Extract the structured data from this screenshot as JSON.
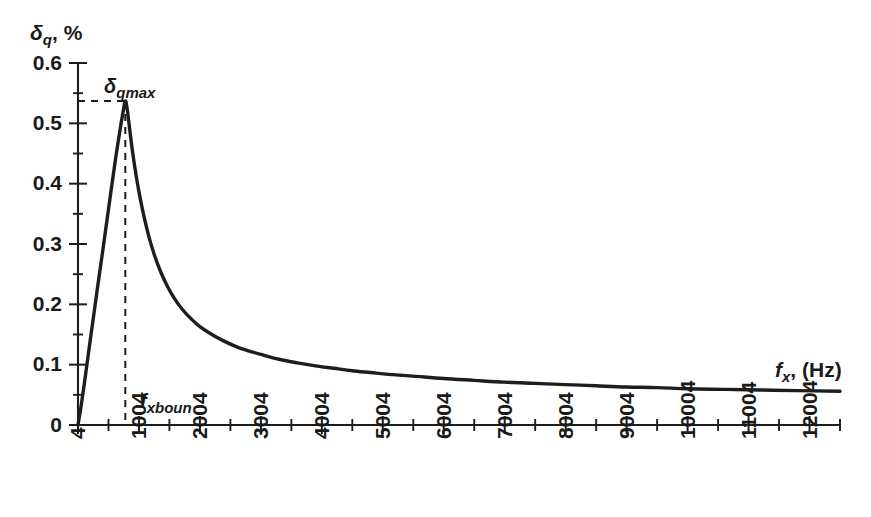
{
  "chart_data": {
    "type": "line",
    "title": "",
    "xlabel": "f_x, (Hz)",
    "ylabel": "δ_q, %",
    "xlabel_parts": {
      "main": "f",
      "sub": "x",
      "tail": ", (Hz)"
    },
    "ylabel_parts": {
      "main": "δ",
      "sub": "q",
      "tail": ", %"
    },
    "xlim": [
      4,
      12504
    ],
    "ylim": [
      0,
      0.6
    ],
    "grid": false,
    "legend": "none",
    "x_ticks": [
      4,
      1004,
      2004,
      3004,
      4004,
      5004,
      6004,
      7004,
      8004,
      9004,
      10004,
      11004,
      12004
    ],
    "x_tick_labels": [
      "4",
      "1004",
      "2004",
      "3004",
      "4004",
      "5004",
      "6004",
      "7004",
      "8004",
      "9004",
      "10004",
      "11004",
      "12004"
    ],
    "x_minor_ticks": [
      504,
      1504,
      2504,
      3504,
      4504,
      5504,
      6504,
      7504,
      8504,
      9504,
      10504,
      11504,
      12504
    ],
    "y_ticks": [
      0,
      0.1,
      0.2,
      0.3,
      0.4,
      0.5,
      0.6
    ],
    "y_tick_labels": [
      "0",
      "0.1",
      "0.2",
      "0.3",
      "0.4",
      "0.5",
      "0.6"
    ],
    "y_minor_ticks": [
      0.05,
      0.15,
      0.25,
      0.35,
      0.45,
      0.55
    ],
    "annotations": [
      {
        "name": "peak-label",
        "text_parts": {
          "main": "δ",
          "sub": "qmax"
        },
        "x": 780,
        "y": 0.585
      },
      {
        "name": "boundary-label",
        "text_parts": {
          "main": "f",
          "sub": "xboun"
        },
        "x": 1700,
        "y": 0.058
      }
    ],
    "markers": {
      "peak_x": 780,
      "peak_y": 0.537,
      "dashed_horizontal_from_x": 4,
      "dashed_vertical_to_y": 0
    },
    "series": [
      {
        "name": "delta_q",
        "color": "#1d1d1d",
        "points": [
          [
            4,
            0.0
          ],
          [
            60,
            0.035
          ],
          [
            130,
            0.085
          ],
          [
            200,
            0.137
          ],
          [
            270,
            0.188
          ],
          [
            340,
            0.239
          ],
          [
            410,
            0.289
          ],
          [
            480,
            0.34
          ],
          [
            550,
            0.391
          ],
          [
            620,
            0.441
          ],
          [
            690,
            0.487
          ],
          [
            740,
            0.517
          ],
          [
            780,
            0.537
          ],
          [
            810,
            0.524
          ],
          [
            850,
            0.492
          ],
          [
            900,
            0.452
          ],
          [
            960,
            0.412
          ],
          [
            1020,
            0.378
          ],
          [
            1090,
            0.344
          ],
          [
            1170,
            0.311
          ],
          [
            1260,
            0.281
          ],
          [
            1360,
            0.254
          ],
          [
            1470,
            0.23
          ],
          [
            1590,
            0.209
          ],
          [
            1720,
            0.191
          ],
          [
            1860,
            0.176
          ],
          [
            2004,
            0.163
          ],
          [
            2200,
            0.15
          ],
          [
            2400,
            0.139
          ],
          [
            2600,
            0.13
          ],
          [
            2800,
            0.123
          ],
          [
            3004,
            0.117
          ],
          [
            3300,
            0.109
          ],
          [
            3600,
            0.103
          ],
          [
            3900,
            0.098
          ],
          [
            4200,
            0.094
          ],
          [
            4500,
            0.09
          ],
          [
            4800,
            0.087
          ],
          [
            5100,
            0.084
          ],
          [
            5500,
            0.081
          ],
          [
            6000,
            0.077
          ],
          [
            6500,
            0.074
          ],
          [
            7000,
            0.071
          ],
          [
            7500,
            0.069
          ],
          [
            8000,
            0.067
          ],
          [
            8500,
            0.065
          ],
          [
            9000,
            0.063
          ],
          [
            9500,
            0.062
          ],
          [
            10004,
            0.06
          ],
          [
            10600,
            0.059
          ],
          [
            11200,
            0.058
          ],
          [
            11800,
            0.057
          ],
          [
            12504,
            0.056
          ]
        ]
      }
    ]
  },
  "figure": {
    "background": "#ffffff",
    "ink_color": "#1d1d1d"
  }
}
